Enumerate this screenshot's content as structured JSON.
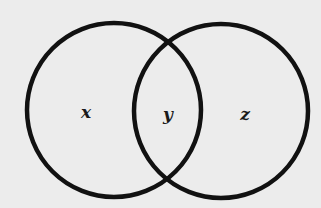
{
  "diagram": {
    "type": "venn",
    "sets": [
      {
        "id": "left",
        "cx": 114,
        "cy": 110,
        "r": 87
      },
      {
        "id": "right",
        "cx": 221,
        "cy": 111,
        "r": 87
      }
    ],
    "regions": [
      {
        "id": "left-only",
        "label": "x",
        "x": 86,
        "y": 118
      },
      {
        "id": "intersection",
        "label": "y",
        "x": 168,
        "y": 120
      },
      {
        "id": "right-only",
        "label": "z",
        "x": 245,
        "y": 120
      }
    ],
    "colors": {
      "stroke": "#111111",
      "background": "#ececec"
    }
  }
}
